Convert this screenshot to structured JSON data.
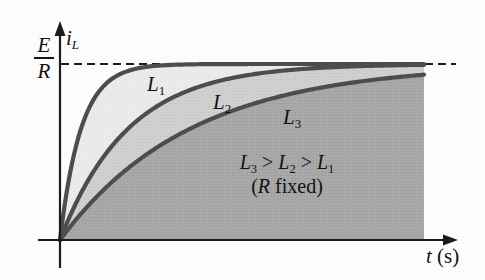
{
  "figure": {
    "background": "#fcfcfc",
    "labels": {
      "y_axis": {
        "base": "i",
        "sub": "L"
      },
      "asymptote": {
        "numerator": "E",
        "denominator": "R"
      },
      "x_axis": {
        "var": "t",
        "unit": " (s)"
      },
      "curves": [
        {
          "base": "L",
          "sub": "1"
        },
        {
          "base": "L",
          "sub": "2"
        },
        {
          "base": "L",
          "sub": "3"
        }
      ],
      "annotation": {
        "p1": "L",
        "s1": "3",
        "p2": " > ",
        "p3": "L",
        "s2": "2",
        "p4": " > ",
        "p5": "L",
        "s3": "1",
        "open": "(",
        "var": "R",
        "rest": " fixed)"
      }
    }
  },
  "chart_data": {
    "type": "line",
    "xlabel": "t (s)",
    "ylabel": "i_L",
    "asymptote_label": "E/R",
    "asymptote_value_normalized": 1,
    "annotation": "L3 > L2 > L1 (R fixed)",
    "curve_model": "i_L(t) = (E/R)(1 - exp(-t/tau)), rise is faster for smaller L",
    "series": [
      {
        "name": "L1",
        "tau_px": 21,
        "fill": "#ebebeb"
      },
      {
        "name": "L2",
        "tau_px": 68,
        "fill": "#d1d1d1"
      },
      {
        "name": "L3",
        "tau_px": 130,
        "fill": "#a9a9a9"
      }
    ],
    "stroke_color": "#4d4d51",
    "axis_color": "#1c1c1c",
    "grid": false,
    "legend_position": "on-curve"
  }
}
